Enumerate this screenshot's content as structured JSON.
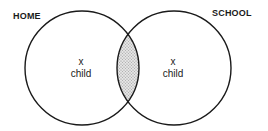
{
  "diagram": {
    "type": "venn",
    "sets": [
      {
        "name": "HOME",
        "marker": "x",
        "member_label": "child"
      },
      {
        "name": "SCHOOL",
        "marker": "x",
        "member_label": "child"
      }
    ],
    "intersection": {
      "style": "shaded",
      "fill_color": "#c8c8c8"
    },
    "stroke_color": "#1a1a1a"
  }
}
